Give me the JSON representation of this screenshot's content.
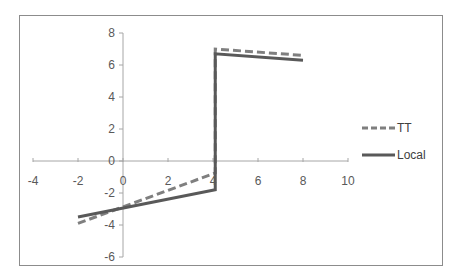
{
  "chart_data": {
    "type": "line",
    "title": "",
    "xlabel": "",
    "ylabel": "",
    "xlim": [
      -4,
      10
    ],
    "ylim": [
      -6,
      8
    ],
    "x_ticks": [
      -4,
      -2,
      0,
      2,
      4,
      6,
      8,
      10
    ],
    "y_ticks": [
      -6,
      -4,
      -2,
      0,
      2,
      4,
      6,
      8
    ],
    "grid": false,
    "legend_position": "right",
    "series": [
      {
        "name": "TT",
        "style": "dashed",
        "color": "#7f7f7f",
        "points": [
          [
            -2,
            -3.9
          ],
          [
            4.1,
            -0.75
          ],
          [
            4.1,
            7.0
          ],
          [
            8,
            6.6
          ]
        ]
      },
      {
        "name": "Local",
        "style": "solid",
        "color": "#595959",
        "points": [
          [
            -2,
            -3.5
          ],
          [
            4.1,
            -1.8
          ],
          [
            4.1,
            6.7
          ],
          [
            8,
            6.3
          ]
        ]
      }
    ]
  },
  "legend": {
    "items": [
      {
        "label": "TT"
      },
      {
        "label": "Local"
      }
    ]
  },
  "axes": {
    "x_labels": [
      "-4",
      "-2",
      "0",
      "2",
      "4",
      "6",
      "8",
      "10"
    ],
    "y_labels": [
      "8",
      "6",
      "4",
      "2",
      "0",
      "-2",
      "-4",
      "-6"
    ]
  }
}
